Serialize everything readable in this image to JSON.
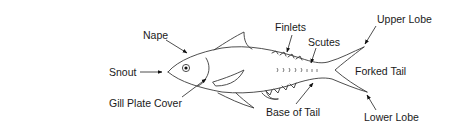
{
  "diagram": {
    "labels": {
      "nape": "Nape",
      "snout": "Snout",
      "gill_plate_cover": "Gill Plate Cover",
      "finlets": "Finlets",
      "scutes": "Scutes",
      "upper_lobe": "Upper Lobe",
      "forked_tail": "Forked Tail",
      "base_of_tail": "Base of Tail",
      "lower_lobe": "Lower Lobe"
    },
    "colors": {
      "background": "#ffffff",
      "outline": "#3a3a3a",
      "text": "#1a1a1a"
    }
  }
}
